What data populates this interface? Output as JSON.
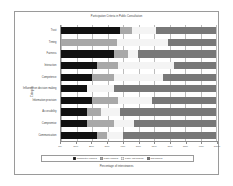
{
  "chart_data": {
    "type": "bar",
    "orientation": "horizontal",
    "stacked": true,
    "normalized_percent": true,
    "title": "Participation Criteria in Public Consultation",
    "xlabel": "Percentage of interviewees",
    "ylabel": "Category",
    "xlim": [
      0,
      100
    ],
    "xticks": [
      "0%",
      "10%",
      "20%",
      "30%",
      "40%",
      "50%",
      "60%",
      "70%",
      "80%",
      "90%",
      "100%"
    ],
    "xtick_values": [
      0,
      10,
      20,
      30,
      40,
      50,
      60,
      70,
      80,
      90,
      100
    ],
    "grid": true,
    "legend_position": "bottom",
    "categories": [
      "Trust",
      "Timing",
      "Fairness",
      "Interaction",
      "Competence",
      "Influence on decision making",
      "Information provision",
      "Accessibility",
      "Compromise",
      "Communication"
    ],
    "series": [
      {
        "name": "Completely fulfilled",
        "color": "#111111",
        "values": [
          38,
          0,
          34,
          23,
          20,
          17,
          20,
          17,
          17,
          23
        ]
      },
      {
        "name": "Partly fulfilled",
        "color": "#a8a8a8",
        "values": [
          8,
          36,
          9,
          14,
          14,
          0,
          17,
          9,
          17,
          7
        ]
      },
      {
        "name": "Partly not fulfilled",
        "color": "#f4f4f4",
        "values": [
          15,
          33,
          7,
          36,
          32,
          17,
          22,
          12,
          13,
          10
        ]
      },
      {
        "name": "Not fulfilled",
        "color": "#787878",
        "values": [
          39,
          31,
          50,
          27,
          34,
          66,
          41,
          62,
          53,
          60
        ]
      }
    ]
  }
}
